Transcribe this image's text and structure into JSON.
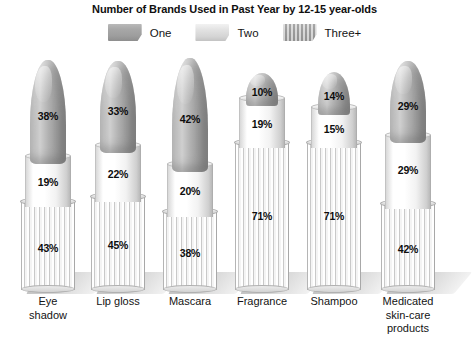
{
  "chart_data": {
    "type": "bar",
    "title": "Number of Brands Used in Past Year by 12-15 year-olds",
    "xlabel": "",
    "ylabel": "",
    "ylim": [
      0,
      100
    ],
    "grid": false,
    "legend_position": "top-center",
    "stacked": true,
    "units": "%",
    "categories": [
      "Eye shadow",
      "Lip gloss",
      "Mascara",
      "Fragrance",
      "Shampoo",
      "Medicated skin-care products"
    ],
    "series": [
      {
        "name": "One",
        "values": [
          38,
          33,
          42,
          10,
          14,
          29
        ]
      },
      {
        "name": "Two",
        "values": [
          19,
          22,
          20,
          19,
          15,
          29
        ]
      },
      {
        "name": "Three+",
        "values": [
          43,
          45,
          38,
          71,
          71,
          42
        ]
      }
    ],
    "data_labels": [
      {
        "category": "Eye shadow",
        "One": "38%",
        "Two": "19%",
        "Three+": "43%"
      },
      {
        "category": "Lip gloss",
        "One": "33%",
        "Two": "22%",
        "Three+": "45%"
      },
      {
        "category": "Mascara",
        "One": "42%",
        "Two": "20%",
        "Three+": "38%"
      },
      {
        "category": "Fragrance",
        "One": "10%",
        "Two": "19%",
        "Three+": "71%"
      },
      {
        "category": "Shampoo",
        "One": "14%",
        "Two": "15%",
        "Three+": "71%"
      },
      {
        "category": "Medicated skin-care products",
        "One": "29%",
        "Two": "29%",
        "Three+": "42%"
      }
    ]
  },
  "title": "Number of Brands Used in Past Year by 12-15 year-olds",
  "legend": {
    "items": [
      {
        "label": "One",
        "swatch": "dark-gray-bullet-swatch",
        "color": "#a3a3a3"
      },
      {
        "label": "Two",
        "swatch": "light-gray-band-swatch",
        "color": "#e0e0e0"
      },
      {
        "label": "Three+",
        "swatch": "striped-base-swatch",
        "color": "#b0b0b0"
      }
    ]
  },
  "categories": [
    {
      "label_lines": [
        "Eye",
        "shadow"
      ],
      "one": "38%",
      "two": "19%",
      "three": "43%"
    },
    {
      "label_lines": [
        "Lip gloss"
      ],
      "one": "33%",
      "two": "22%",
      "three": "45%"
    },
    {
      "label_lines": [
        "Mascara"
      ],
      "one": "42%",
      "two": "20%",
      "three": "38%"
    },
    {
      "label_lines": [
        "Fragrance"
      ],
      "one": "10%",
      "two": "19%",
      "three": "71%"
    },
    {
      "label_lines": [
        "Shampoo"
      ],
      "one": "14%",
      "two": "15%",
      "three": "71%"
    },
    {
      "label_lines": [
        "Medicated",
        "skin-care",
        "products"
      ],
      "one": "29%",
      "two": "29%",
      "three": "42%"
    }
  ]
}
